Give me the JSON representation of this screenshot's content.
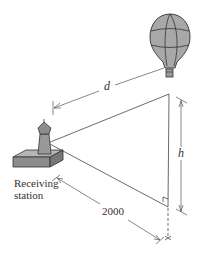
{
  "diagram": {
    "labels": {
      "distance": "d",
      "height": "h",
      "ground_distance": "2000",
      "station_line1": "Receiving",
      "station_line2": "station"
    },
    "colors": {
      "line": "#333333",
      "balloon_fill": "#a8a8a8",
      "station_fill": "#8c8c8c",
      "station_top": "#b5b5b5"
    },
    "objects": [
      "hot-air-balloon",
      "receiving-station",
      "right-triangle",
      "right-angle-marker"
    ]
  }
}
